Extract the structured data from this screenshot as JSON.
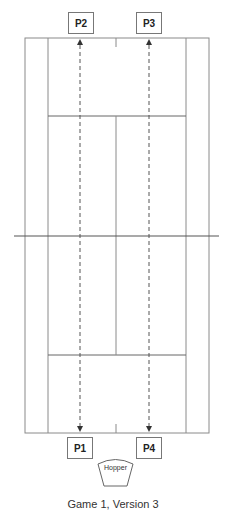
{
  "diagram": {
    "type": "tennis-court-drill",
    "players": [
      {
        "id": "p2",
        "label": "P2",
        "side": "top",
        "x": 68,
        "y": 12
      },
      {
        "id": "p3",
        "label": "P3",
        "side": "top",
        "x": 136,
        "y": 12
      },
      {
        "id": "p1",
        "label": "P1",
        "side": "bottom",
        "x": 67,
        "y": 437
      },
      {
        "id": "p4",
        "label": "P4",
        "side": "bottom",
        "x": 136,
        "y": 437
      }
    ],
    "hopper": {
      "label": "Hopper"
    },
    "caption": "Game 1, Version 3",
    "colors": {
      "court_lines": "#8a8a8a",
      "net": "#555555",
      "paths": "#555555",
      "box_border": "#777777"
    }
  }
}
